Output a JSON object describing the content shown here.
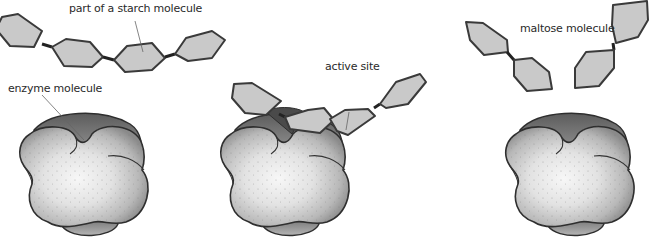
{
  "diagram": {
    "stages": [
      {
        "id": "stage-1",
        "labels": [
          "part of a starch molecule",
          "enzyme molecule"
        ]
      },
      {
        "id": "stage-2",
        "labels": [
          "active site"
        ]
      },
      {
        "id": "stage-3",
        "labels": [
          "maltose molecule"
        ]
      }
    ]
  },
  "labels": {
    "starch": "part of a starch molecule",
    "enzyme": "enzyme molecule",
    "active_site": "active site",
    "maltose": "maltose molecule"
  },
  "colors": {
    "hexagon_fill": "#c9c9c9",
    "outline": "#3a3a3a",
    "enzyme_light": "#f2f2f2",
    "enzyme_dark": "#6e6e6e"
  }
}
